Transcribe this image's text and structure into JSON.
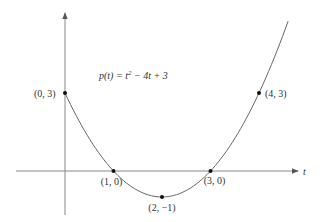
{
  "chart_data": {
    "type": "line",
    "title": "",
    "function_label": "p(t) = t² − 4t + 3",
    "function_parts": {
      "lhs": "p(t) = t",
      "exp": "2",
      "rhs": " − 4t + 3"
    },
    "xlabel": "t",
    "ylabel": "",
    "grid": false,
    "legend": "none",
    "xlim": [
      -1,
      5
    ],
    "ylim": [
      -1.5,
      5.5
    ],
    "curve": {
      "t_start": 0,
      "t_end": 4.6,
      "formula": "t^2 - 4t + 3"
    },
    "points": [
      {
        "t": 0,
        "y": 3,
        "label": "(0, 3)"
      },
      {
        "t": 1,
        "y": 0,
        "label": "(1, 0)"
      },
      {
        "t": 2,
        "y": -1,
        "label": "(2, −1)"
      },
      {
        "t": 3,
        "y": 0,
        "label": "(3, 0)"
      },
      {
        "t": 4,
        "y": 3,
        "label": "(4, 3)"
      }
    ]
  },
  "layout": {
    "origin_px": [
      65,
      171
    ],
    "px_per_t": 48.5,
    "px_per_y": 26,
    "axis_color": "#888888",
    "curve_color": "#666666",
    "point_color": "#111111"
  }
}
